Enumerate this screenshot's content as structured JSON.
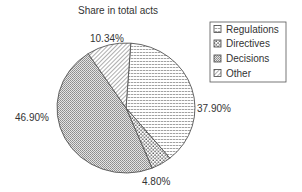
{
  "chart_data": {
    "type": "pie",
    "title": "Share in total acts",
    "slices": [
      {
        "name": "Regulations",
        "value": 37.9,
        "label": "37.90%",
        "pattern": "horizontal-lines"
      },
      {
        "name": "Directives",
        "value": 4.8,
        "label": "4.80%",
        "pattern": "sparse-dots"
      },
      {
        "name": "Decisions",
        "value": 46.9,
        "label": "46.90%",
        "pattern": "dense-dots"
      },
      {
        "name": "Other",
        "value": 10.34,
        "label": "10.34%",
        "pattern": "diagonal-lines"
      }
    ],
    "start_angle_deg": 4,
    "direction": "clockwise",
    "legend": {
      "position": "top-right",
      "entries": [
        "Regulations",
        "Directives",
        "Decisions",
        "Other"
      ]
    }
  },
  "colors": {
    "outline": "#555555",
    "pattern_ink": "#6a6a6a",
    "text": "#333333",
    "background": "#ffffff"
  }
}
